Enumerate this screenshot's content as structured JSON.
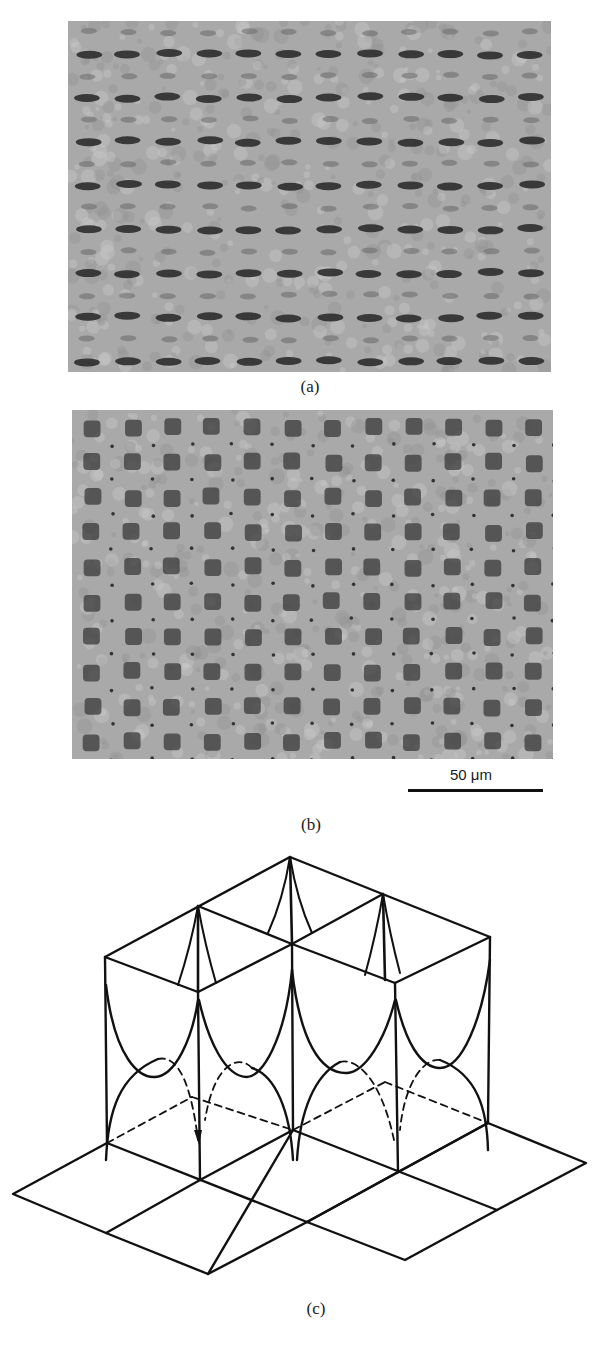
{
  "figure": {
    "panels": [
      {
        "id": "a",
        "caption": "(a)",
        "kind": "micrograph",
        "description": "Grayscale optical micrograph of a square lattice pattern of elongated dark spots with grain-boundary defects",
        "bounds": {
          "x": 68,
          "y": 21,
          "w": 483,
          "h": 351
        },
        "lattice": {
          "rows": 16,
          "cols": 12,
          "spot_shape": "elongated-horizontal"
        }
      },
      {
        "id": "b",
        "caption": "(b)",
        "kind": "micrograph",
        "description": "Grayscale optical micrograph of a square lattice of dark square spots with small dots between, showing domain boundaries",
        "bounds": {
          "x": 72,
          "y": 410,
          "w": 481,
          "h": 349
        },
        "lattice": {
          "rows": 10,
          "cols": 12,
          "spot_shape": "square"
        },
        "scale_bar": {
          "label": "50 μm",
          "length_px": 135
        }
      },
      {
        "id": "c",
        "caption": "(c)",
        "kind": "schematic",
        "description": "Isometric schematic of square cells with vertical walls and parabolic curves above a rhombic ground grid; hidden lines dashed"
      }
    ]
  },
  "colors": {
    "background": "#ffffff",
    "ink": "#111111",
    "micrograph_base": "#a9a9a9",
    "micrograph_light": "#cfcfcf",
    "micrograph_spot": "#3a3a3a"
  }
}
